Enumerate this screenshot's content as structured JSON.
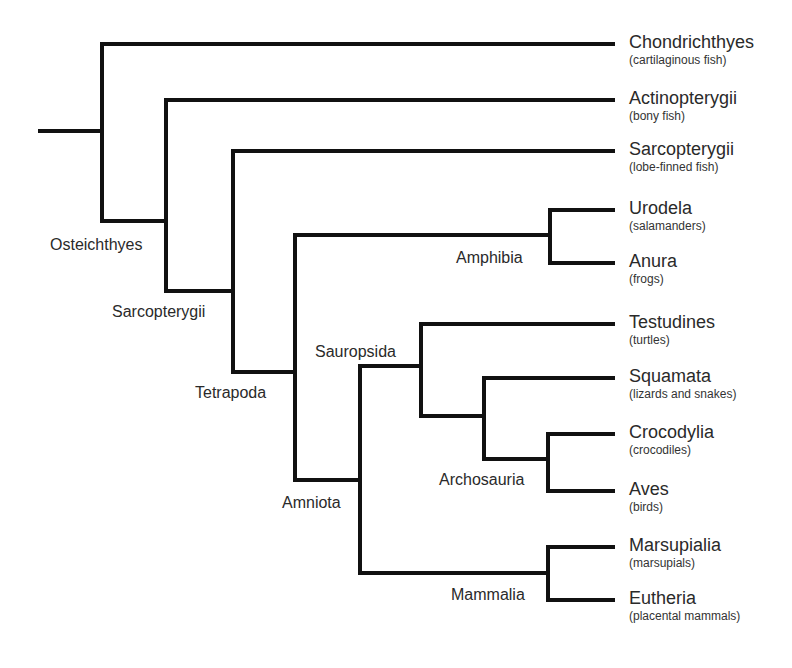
{
  "diagram": {
    "type": "cladogram",
    "line_color": "#111111",
    "line_width": 4,
    "root": {
      "x1": 40,
      "x2": 102,
      "y": 131
    },
    "leaves": [
      {
        "id": "chondrichthyes",
        "name": "Chondrichthyes",
        "common": "(cartilaginous fish)",
        "y": 44
      },
      {
        "id": "actinopterygii",
        "name": "Actinopterygii",
        "common": "(bony fish)",
        "y": 100
      },
      {
        "id": "sarcopterygii-leaf",
        "name": "Sarcopterygii",
        "common": "(lobe-finned fish)",
        "y": 151
      },
      {
        "id": "urodela",
        "name": "Urodela",
        "common": "(salamanders)",
        "y": 210
      },
      {
        "id": "anura",
        "name": "Anura",
        "common": "(frogs)",
        "y": 263
      },
      {
        "id": "testudines",
        "name": "Testudines",
        "common": "(turtles)",
        "y": 324
      },
      {
        "id": "squamata",
        "name": "Squamata",
        "common": "(lizards and snakes)",
        "y": 378
      },
      {
        "id": "crocodylia",
        "name": "Crocodylia",
        "common": "(crocodiles)",
        "y": 434
      },
      {
        "id": "aves",
        "name": "Aves",
        "common": "(birds)",
        "y": 491
      },
      {
        "id": "marsupialia",
        "name": "Marsupialia",
        "common": "(marsupials)",
        "y": 547
      },
      {
        "id": "eutheria",
        "name": "Eutheria",
        "common": "(placental mammals)",
        "y": 600
      }
    ],
    "leaf_line_end_x": 613,
    "clades": [
      {
        "id": "osteichthyes",
        "label": "Osteichthyes",
        "label_x": 50,
        "label_y": 236
      },
      {
        "id": "sarcopterygii",
        "label": "Sarcopterygii",
        "label_x": 112,
        "label_y": 303
      },
      {
        "id": "tetrapoda",
        "label": "Tetrapoda",
        "label_x": 195,
        "label_y": 384
      },
      {
        "id": "amniota",
        "label": "Amniota",
        "label_x": 282,
        "label_y": 494
      },
      {
        "id": "amphibia",
        "label": "Amphibia",
        "label_x": 456,
        "label_y": 249
      },
      {
        "id": "sauropsida",
        "label": "Sauropsida",
        "label_x": 315,
        "label_y": 343
      },
      {
        "id": "archosauria",
        "label": "Archosauria",
        "label_x": 439,
        "label_y": 471
      },
      {
        "id": "mammalia",
        "label": "Mammalia",
        "label_x": 451,
        "label_y": 586
      }
    ],
    "segments": [
      [
        40,
        131,
        102,
        131
      ],
      [
        102,
        44,
        102,
        221
      ],
      [
        102,
        44,
        613,
        44
      ],
      [
        102,
        221,
        166,
        221
      ],
      [
        166,
        100,
        166,
        291
      ],
      [
        166,
        100,
        613,
        100
      ],
      [
        166,
        291,
        233,
        291
      ],
      [
        233,
        151,
        233,
        372
      ],
      [
        233,
        151,
        613,
        151
      ],
      [
        233,
        372,
        295,
        372
      ],
      [
        295,
        235,
        295,
        480
      ],
      [
        295,
        235,
        550,
        235
      ],
      [
        550,
        210,
        550,
        263
      ],
      [
        550,
        210,
        613,
        210
      ],
      [
        550,
        263,
        613,
        263
      ],
      [
        295,
        480,
        360,
        480
      ],
      [
        360,
        366,
        360,
        573
      ],
      [
        360,
        366,
        421,
        366
      ],
      [
        421,
        324,
        421,
        416
      ],
      [
        421,
        324,
        613,
        324
      ],
      [
        421,
        416,
        484,
        416
      ],
      [
        484,
        378,
        484,
        459
      ],
      [
        484,
        378,
        613,
        378
      ],
      [
        484,
        459,
        548,
        459
      ],
      [
        548,
        434,
        548,
        491
      ],
      [
        548,
        434,
        613,
        434
      ],
      [
        548,
        491,
        613,
        491
      ],
      [
        360,
        573,
        548,
        573
      ],
      [
        548,
        547,
        548,
        600
      ],
      [
        548,
        547,
        613,
        547
      ],
      [
        548,
        600,
        613,
        600
      ]
    ]
  }
}
